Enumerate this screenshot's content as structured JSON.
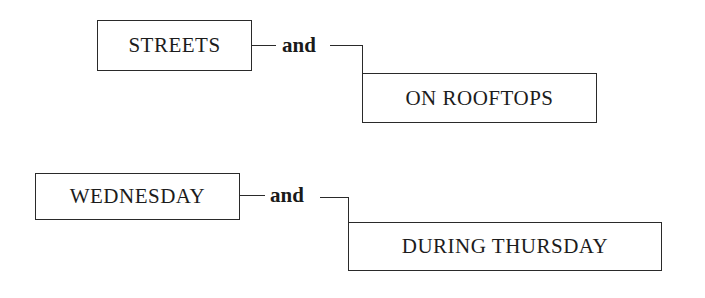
{
  "diagrams": [
    {
      "left_term": "STREETS",
      "conjunction": "and",
      "right_term": "ON ROOFTOPS"
    },
    {
      "left_term": "WEDNESDAY",
      "conjunction": "and",
      "right_term": "DURING THURSDAY"
    }
  ],
  "colors": {
    "line": "#2a2a2a",
    "text": "#1c1c1c",
    "background": "#ffffff"
  }
}
